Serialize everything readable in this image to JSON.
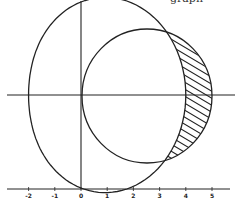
{
  "figure": {
    "curves": [
      {
        "name": "limacon",
        "equation": "r = 3 + cos(theta)"
      },
      {
        "name": "circle",
        "equation": "r = 5 cos(theta)"
      }
    ],
    "shaded_region": "inside circle, outside limacon",
    "x_tick_labels": [
      "-2",
      "-1",
      "0",
      "1",
      "2",
      "3",
      "4",
      "5"
    ],
    "top_text_fragment": "graph",
    "stroke_color": "#222222",
    "background_color": "#ffffff"
  }
}
